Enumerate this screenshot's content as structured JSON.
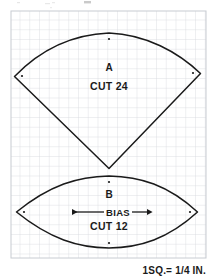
{
  "document": {
    "title": "Quilt Pattern Template Sheet",
    "type": "sewing-pattern-diagram",
    "background_color": "#ffffff",
    "ink_color": "#1a1a1a"
  },
  "grid": {
    "label": "graph-paper-grid",
    "x": 11,
    "y": 11,
    "width": 195,
    "height": 247,
    "cell_size": 9.75,
    "columns": 20,
    "rows": 26,
    "line_color": "#d5d8dd",
    "border_color": "#c8ccd2",
    "visible": true
  },
  "scale_note": {
    "text": "1SQ.= 1/4 IN.",
    "x": 150,
    "y": 270
  },
  "pieces": [
    {
      "id": "piece-a",
      "label": "A",
      "cut_label": "CUT 24",
      "shape": "fan-wedge",
      "label_x": 109,
      "label_y": 71,
      "cut_x": 109,
      "cut_y": 89,
      "outline": "M 14.5 76.5 C 40 50 72 34.5 109 33.0 C 146 34.5 178 52 200.5 73.5 L 109 168.5 Z",
      "dots": [
        {
          "x": 22,
          "y": 76
        },
        {
          "x": 109,
          "y": 39
        },
        {
          "x": 193,
          "y": 73
        }
      ]
    },
    {
      "id": "piece-b",
      "label": "B",
      "cut_label": "CUT 12",
      "bias_label": "BIAS",
      "shape": "lens-leaf",
      "label_x": 109,
      "label_y": 196,
      "bias_x": 109,
      "bias_y": 212,
      "cut_x": 109,
      "cut_y": 228,
      "outline": "M 16.5 212.0 C 50 185 78 176.5 109 176.0 C 140 176.5 168 185 197.5 212.0 C 168 239 140 247.5 109 248.0 C 78 247.5 50 239 16.5 212.0 Z",
      "dots": [
        {
          "x": 24,
          "y": 212
        },
        {
          "x": 109,
          "y": 182
        },
        {
          "x": 190,
          "y": 212
        },
        {
          "x": 109,
          "y": 243
        }
      ],
      "bias_arrow": {
        "x1": 72,
        "x2": 147,
        "y": 212,
        "direction": "double"
      }
    }
  ]
}
